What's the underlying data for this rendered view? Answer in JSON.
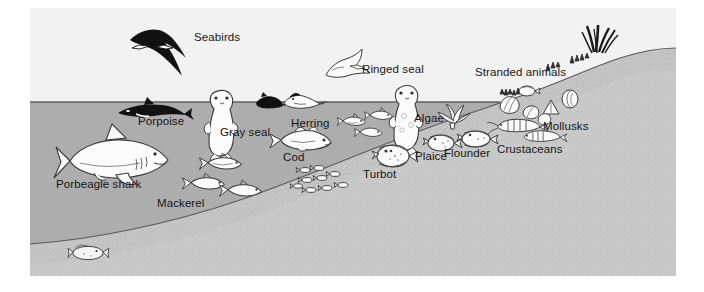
{
  "figure": {
    "colors": {
      "page_background": "#ffffff",
      "sky": "#f2f2f2",
      "water": "#adadad",
      "sand": "#c9c9c9",
      "sand_dark": "#bdbdbd",
      "outline": "#3a3a3a",
      "silhouette": "#111111",
      "label_text": "#161616"
    }
  },
  "labels": [
    {
      "id": "seabirds",
      "text": "Seabirds",
      "x": 194,
      "y": 31
    },
    {
      "id": "ringed-seal",
      "text": "Ringed seal",
      "x": 362,
      "y": 63
    },
    {
      "id": "stranded-animals",
      "text": "Stranded animals",
      "x": 475,
      "y": 66
    },
    {
      "id": "porpoise",
      "text": "Porpoise",
      "x": 138,
      "y": 115
    },
    {
      "id": "gray-seal",
      "text": "Gray seal",
      "x": 220,
      "y": 126
    },
    {
      "id": "herring",
      "text": "Herring",
      "x": 291,
      "y": 117
    },
    {
      "id": "algae",
      "text": "Algae",
      "x": 414,
      "y": 112
    },
    {
      "id": "mollusks",
      "text": "Mollusks",
      "x": 543,
      "y": 120
    },
    {
      "id": "cod",
      "text": "Cod",
      "x": 283,
      "y": 151
    },
    {
      "id": "plaice",
      "text": "Plaice",
      "x": 415,
      "y": 150
    },
    {
      "id": "flounder",
      "text": "Flounder",
      "x": 444,
      "y": 147
    },
    {
      "id": "crustaceans",
      "text": "Crustaceans",
      "x": 497,
      "y": 143
    },
    {
      "id": "turbot",
      "text": "Turbot",
      "x": 363,
      "y": 168
    },
    {
      "id": "porbeagle-shark",
      "text": "Porbeagle shark",
      "x": 56,
      "y": 178
    },
    {
      "id": "mackerel",
      "text": "Mackerel",
      "x": 157,
      "y": 197
    }
  ],
  "organisms": [
    {
      "id": "albatross",
      "name": "Albatross silhouette flying",
      "habitat": "air"
    },
    {
      "id": "gull",
      "name": "Gull outline flying",
      "habitat": "air"
    },
    {
      "id": "porpoise",
      "name": "Porpoise at surface",
      "habitat": "surface"
    },
    {
      "id": "gray-seal",
      "name": "Gray seal upright in water",
      "habitat": "water"
    },
    {
      "id": "ringed-seal",
      "name": "Ringed seal upright in water",
      "habitat": "water"
    },
    {
      "id": "diving-birds",
      "name": "Two diving seabirds at surface",
      "habitat": "surface"
    },
    {
      "id": "herring",
      "name": "Herring shoal",
      "habitat": "water"
    },
    {
      "id": "cod",
      "name": "Cod",
      "habitat": "water"
    },
    {
      "id": "mackerel",
      "name": "Mackerel group",
      "habitat": "water"
    },
    {
      "id": "fry-school",
      "name": "School of small fish",
      "habitat": "water"
    },
    {
      "id": "porbeagle-shark",
      "name": "Porbeagle shark",
      "habitat": "water"
    },
    {
      "id": "turbot",
      "name": "Turbot flatfish on seabed",
      "habitat": "seabed"
    },
    {
      "id": "plaice",
      "name": "Plaice flatfish on seabed",
      "habitat": "seabed"
    },
    {
      "id": "flounder",
      "name": "Flounder flatfish on seabed",
      "habitat": "seabed"
    },
    {
      "id": "algae",
      "name": "Algae clump",
      "habitat": "seabed"
    },
    {
      "id": "crustaceans",
      "name": "Shrimp crustaceans",
      "habitat": "seabed"
    },
    {
      "id": "mollusks",
      "name": "Shells and mollusks",
      "habitat": "seabed"
    },
    {
      "id": "stranded-animals",
      "name": "Stranded animals on shore",
      "habitat": "shore"
    },
    {
      "id": "beach-grass",
      "name": "Beach grass tufts on dune",
      "habitat": "dune"
    },
    {
      "id": "deep-flatfish",
      "name": "Flatfish on deep seabed",
      "habitat": "seabed"
    }
  ]
}
